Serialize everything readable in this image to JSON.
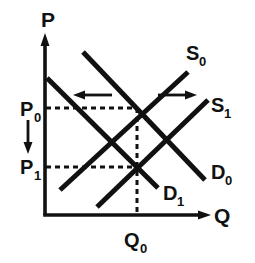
{
  "figure": {
    "type": "economics-supply-demand-diagram",
    "background_color": "#ffffff",
    "ink_color": "#111111"
  },
  "axes": {
    "y_axis_label": "P",
    "x_axis_label": "Q",
    "origin_px": [
      45,
      215
    ],
    "y_axis_top_px": [
      45,
      36
    ],
    "x_axis_right_px": [
      210,
      215
    ]
  },
  "price_levels": [
    {
      "id": "P0",
      "label": "P",
      "sub": "0",
      "y_px": 108
    },
    {
      "id": "P1",
      "label": "P",
      "sub": "1",
      "y_px": 167
    }
  ],
  "quantity_levels": [
    {
      "id": "Q0",
      "label": "Q",
      "sub": "0",
      "x_px": 137
    }
  ],
  "curves": [
    {
      "id": "S0",
      "label": "S",
      "sub": "0",
      "kind": "supply",
      "slope": "upward",
      "from_px": [
        60,
        190
      ],
      "to_px": [
        188,
        72
      ]
    },
    {
      "id": "S1",
      "label": "S",
      "sub": "1",
      "kind": "supply",
      "slope": "upward",
      "from_px": [
        97,
        207
      ],
      "to_px": [
        208,
        100
      ]
    },
    {
      "id": "D0",
      "label": "D",
      "sub": "0",
      "kind": "demand",
      "slope": "downward",
      "from_px": [
        83,
        52
      ],
      "to_px": [
        205,
        180
      ]
    },
    {
      "id": "D1",
      "label": "D",
      "sub": "1",
      "kind": "demand",
      "slope": "downward",
      "from_px": [
        47,
        78
      ],
      "to_px": [
        158,
        188
      ]
    }
  ],
  "equilibria": [
    {
      "id": "E0",
      "price": "P0",
      "quantity": "Q0",
      "px": [
        137,
        108
      ]
    },
    {
      "id": "E1",
      "price": "P1",
      "quantity": "Q0",
      "px": [
        137,
        167
      ]
    }
  ],
  "shift_arrows": [
    {
      "id": "demand-shift-left",
      "direction": "left",
      "meaning": "demand shifts left",
      "from_px": [
        112,
        95
      ],
      "to_px": [
        74,
        95
      ]
    },
    {
      "id": "supply-shift-right",
      "direction": "right",
      "meaning": "supply shifts right",
      "from_px": [
        158,
        95
      ],
      "to_px": [
        196,
        95
      ]
    },
    {
      "id": "price-shift-down",
      "direction": "down",
      "meaning": "price falls",
      "from_px": [
        28,
        120
      ],
      "to_px": [
        28,
        152
      ]
    }
  ],
  "guides": [
    {
      "id": "p0-guide",
      "orientation": "horizontal",
      "from_px": [
        46,
        108
      ],
      "to_px": [
        137,
        108
      ]
    },
    {
      "id": "p1-guide",
      "orientation": "horizontal",
      "from_px": [
        46,
        167
      ],
      "to_px": [
        137,
        167
      ]
    },
    {
      "id": "q0-guide",
      "orientation": "vertical",
      "from_px": [
        137,
        108
      ],
      "to_px": [
        137,
        215
      ]
    }
  ],
  "labels": {
    "P_axis": "P",
    "Q_axis": "Q",
    "P0_main": "P",
    "P0_sub": "0",
    "P1_main": "P",
    "P1_sub": "1",
    "Q0_main": "Q",
    "Q0_sub": "0",
    "S0_main": "S",
    "S0_sub": "0",
    "S1_main": "S",
    "S1_sub": "1",
    "D0_main": "D",
    "D0_sub": "0",
    "D1_main": "D",
    "D1_sub": "1"
  }
}
